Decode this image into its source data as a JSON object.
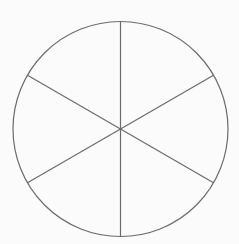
{
  "diagram": {
    "type": "segmented-circle",
    "background": "#fbfbfb",
    "stroke_color": "#6b6b6b",
    "stroke_width": 1.2,
    "circle": {
      "cx": 120.5,
      "cy": 129,
      "r": 107.5
    },
    "segments": 6,
    "spokes": [
      {
        "x1": 120.5,
        "y1": 21.5,
        "x2": 120.5,
        "y2": 236.5
      },
      {
        "x1": 27.5,
        "y1": 75.25,
        "x2": 213.5,
        "y2": 182.75
      },
      {
        "x1": 213.5,
        "y1": 75.25,
        "x2": 27.5,
        "y2": 182.75
      }
    ]
  }
}
